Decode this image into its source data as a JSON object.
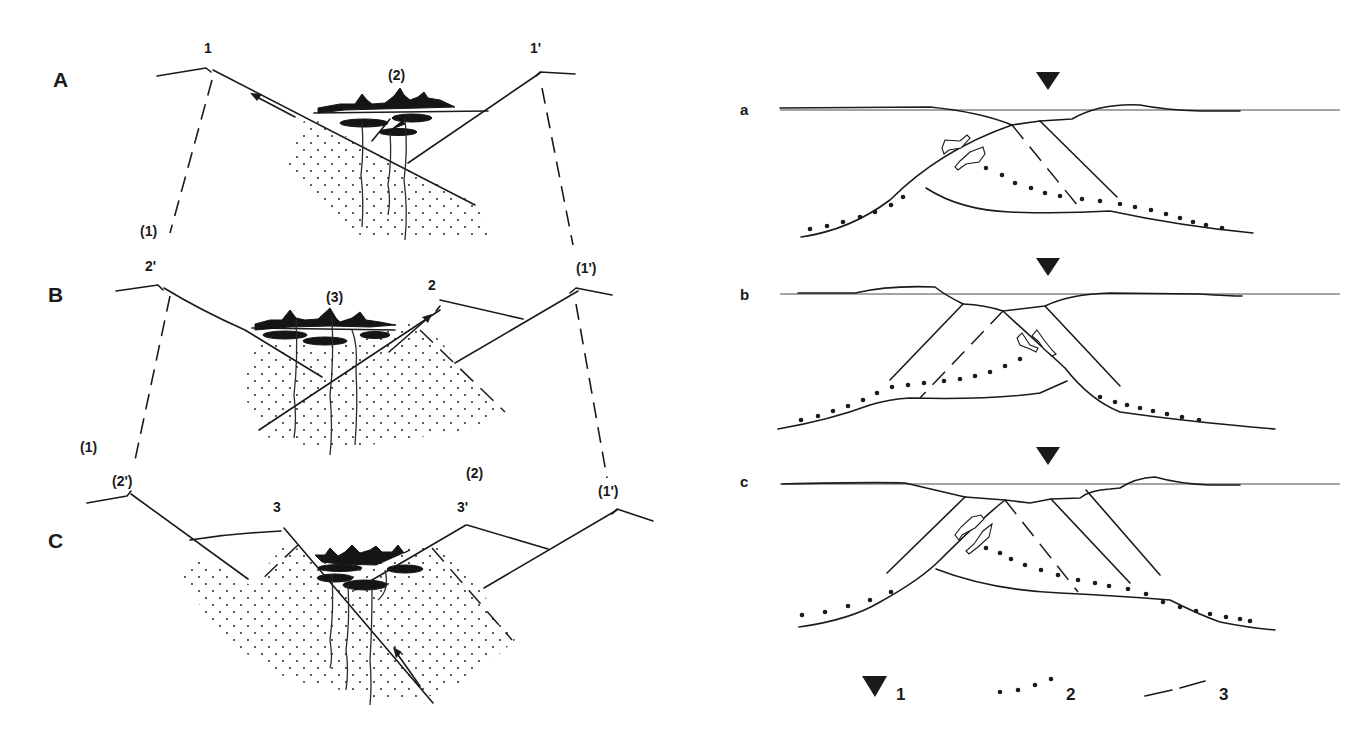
{
  "figure": {
    "left_panels": [
      {
        "id": "A",
        "label": "A",
        "point_labels": {
          "left": "1",
          "right": "1'",
          "ore": "(2)"
        }
      },
      {
        "id": "B",
        "label": "B",
        "point_labels": {
          "prev_left": "(1)",
          "left": "2'",
          "right_fault": "2",
          "prev_right": "(1')",
          "ore": "(3)"
        }
      },
      {
        "id": "C",
        "label": "C",
        "point_labels": {
          "prev_left": "(1)",
          "left": "(2')",
          "center_left": "3",
          "prev_right_inner": "(2)",
          "center_right": "3'",
          "prev_right": "(1')"
        }
      }
    ],
    "right_panels": [
      {
        "id": "a",
        "label": "a"
      },
      {
        "id": "b",
        "label": "b"
      },
      {
        "id": "c",
        "label": "c"
      }
    ],
    "legend": [
      {
        "symbol": "inverted-triangle",
        "label": "1"
      },
      {
        "symbol": "dotted-line",
        "label": "2"
      },
      {
        "symbol": "dashed-line",
        "label": "3"
      }
    ],
    "colors": {
      "ink": "#1a1a1a",
      "background": "#ffffff"
    }
  }
}
